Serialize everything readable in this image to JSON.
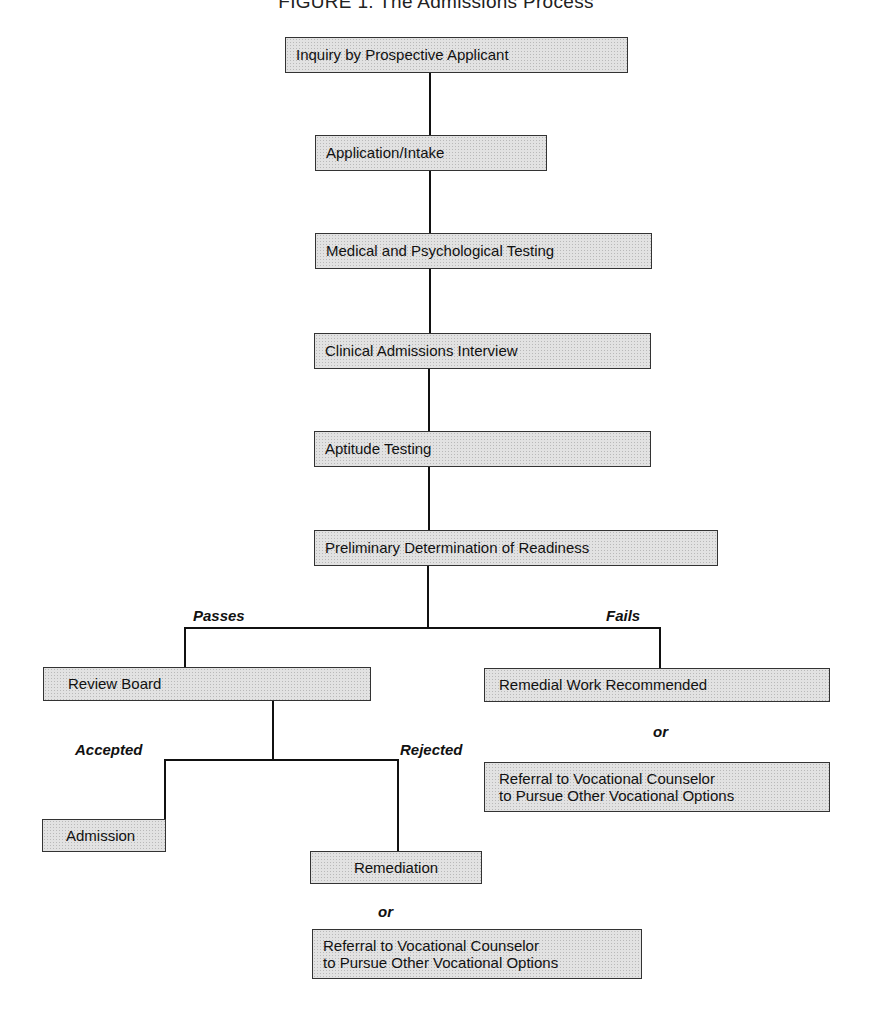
{
  "figure": {
    "title": "FIGURE 1. The Admissions Process"
  },
  "nodes": {
    "inquiry": "Inquiry by Prospective Applicant",
    "application": "Application/Intake",
    "medical": "Medical and Psychological Testing",
    "clinical": "Clinical Admissions Interview",
    "aptitude": "Aptitude Testing",
    "preliminary": "Preliminary Determination of Readiness",
    "review_board": "Review Board",
    "remedial_work": "Remedial Work Recommended",
    "referral_right_line1": "Referral to Vocational Counselor",
    "referral_right_line2": "to Pursue Other Vocational Options",
    "admission": "Admission",
    "remediation": "Remediation",
    "referral_bottom_line1": "Referral to Vocational Counselor",
    "referral_bottom_line2": "to Pursue Other Vocational Options"
  },
  "edge_labels": {
    "passes": "Passes",
    "fails": "Fails",
    "accepted": "Accepted",
    "rejected": "Rejected",
    "or_right": "or",
    "or_bottom": "or"
  }
}
